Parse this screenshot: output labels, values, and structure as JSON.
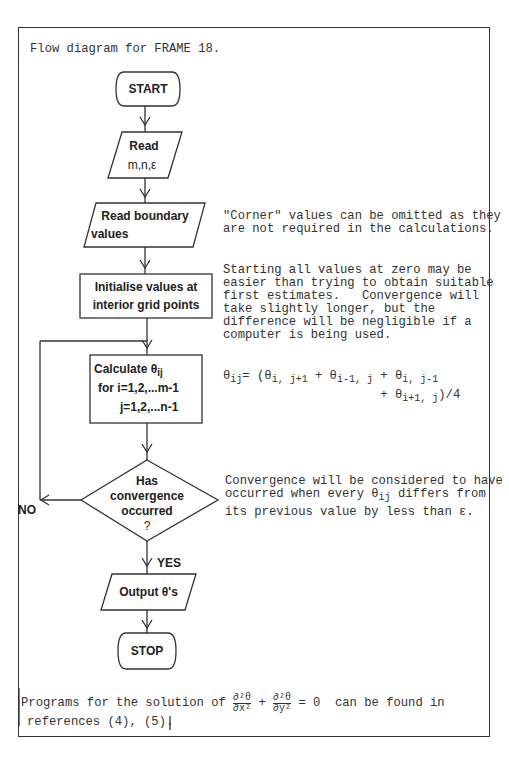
{
  "title": "Flow diagram for FRAME 18.",
  "flowchart": {
    "start": "START",
    "read_params": {
      "line1": "Read",
      "line2": "m,n,ε"
    },
    "read_boundary": {
      "line1": "Read boundary",
      "line2": "values"
    },
    "initialise": {
      "line1": "Initialise values at",
      "line2": "interior grid points"
    },
    "calculate": {
      "line1": "Calculate θ",
      "line1_sub": "ij",
      "line2": "for i=1,2,...m-1",
      "line3": "j=1,2,...n-1"
    },
    "decision": {
      "line1": "Has",
      "line2": "convergence",
      "line3": "occurred",
      "line4": "?"
    },
    "no_label": "NO",
    "yes_label": "YES",
    "output": "Output θ's",
    "stop": "STOP"
  },
  "notes": {
    "corner": [
      "\"Corner\" values can be omitted as they",
      "are not required in the calculations."
    ],
    "starting": [
      "Starting all values at zero may be",
      "easier than trying to obtain suitable",
      "first estimates.   Convergence will",
      "take slightly longer, but the",
      "difference will be negligible if a",
      "computer is being used."
    ],
    "formula": {
      "lhs": "θ",
      "lhs_sub": "ij",
      "eq": "= (",
      "t1_sub": "i, j+1",
      "t2_sub": "i-1, j",
      "t3_sub": "i, j-1",
      "t4_sub": "i+1, j",
      "plus": " + ",
      "theta": "θ",
      "end": ")/4"
    },
    "convergence": {
      "line1": "Convergence will be considered to have",
      "line2_a": "occurred when every ",
      "line2_theta": "θ",
      "line2_sub": "ij",
      "line2_b": " differs from",
      "line3": "its previous value by less than ε."
    }
  },
  "footer": {
    "part1": "Programs for the solution of ",
    "num1": "∂²θ",
    "den1": "∂x²",
    "plus": " + ",
    "num2": "∂²θ",
    "den2": "∂y²",
    "part2": " = 0  can be found in",
    "line2": "references (4), (5)."
  }
}
